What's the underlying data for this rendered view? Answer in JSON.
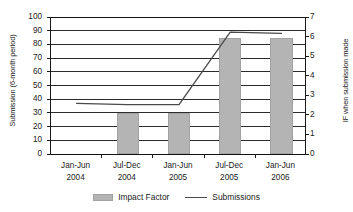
{
  "chart_data": {
    "type": "bar",
    "title": "",
    "subtitle": "",
    "categories": [
      "Jan-Jun 2004",
      "Jul-Dec 2004",
      "Jan-Jun 2005",
      "Jul-Dec 2005",
      "Jan-Jun 2006"
    ],
    "category_lines": [
      [
        "Jan-Jun",
        "2004"
      ],
      [
        "Jul-Dec",
        "2004"
      ],
      [
        "Jan-Jun",
        "2005"
      ],
      [
        "Jul-Dec",
        "2005"
      ],
      [
        "Jan-Jun",
        "2006"
      ]
    ],
    "series": [
      {
        "name": "Impact Factor",
        "type": "bar",
        "axis": "right",
        "color": "#b4b4b4",
        "values": [
          null,
          2.1,
          2.1,
          5.95,
          5.95
        ]
      },
      {
        "name": "Submissions",
        "type": "line",
        "axis": "left",
        "color": "#4a4a4a",
        "values": [
          37,
          36,
          36,
          89,
          88
        ]
      }
    ],
    "xlabel": "",
    "ylabel": "Submission (6-month period)",
    "ylabel_right": "IF when submission made",
    "ylim": [
      0,
      100
    ],
    "ylim_right": [
      0,
      7
    ],
    "yticks": [
      0,
      10,
      20,
      30,
      40,
      50,
      60,
      70,
      80,
      90,
      100
    ],
    "yticks_right": [
      0,
      1,
      2,
      3,
      4,
      5,
      6,
      7
    ],
    "ytick_labels": [
      "0",
      "10",
      "20",
      "30",
      "40",
      "50",
      "60",
      "70",
      "80",
      "90",
      "100"
    ],
    "ytick_labels_right": [
      "0",
      "1",
      "2",
      "3",
      "4",
      "5",
      "6",
      "7"
    ],
    "grid": true,
    "grid_axis": "y-left",
    "legend": [
      "Impact Factor",
      "Submissions"
    ],
    "legend_position": "bottom-center"
  }
}
